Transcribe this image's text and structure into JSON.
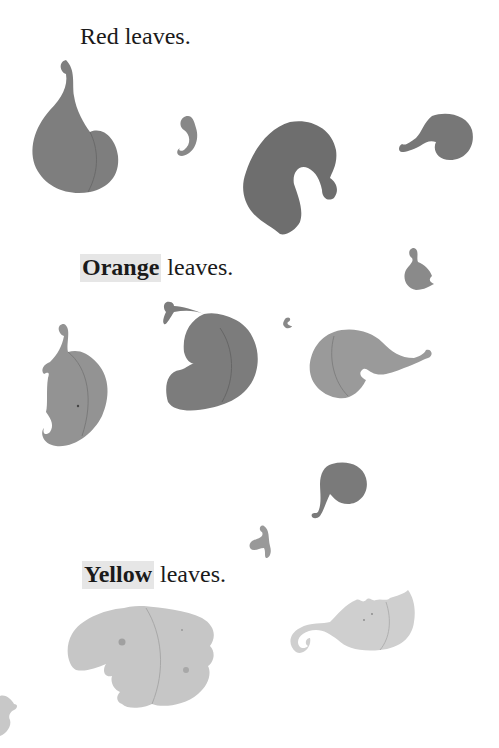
{
  "page": {
    "background": "#ffffff",
    "captions": [
      {
        "id": "red",
        "highlight": "",
        "text": "Red leaves."
      },
      {
        "id": "orange",
        "highlight": "Orange",
        "text": " leaves."
      },
      {
        "id": "yellow",
        "highlight": "Yellow",
        "text": " leaves."
      }
    ],
    "illustrations": {
      "red_leaves": {
        "count": 4,
        "tone": "#7a7a7a"
      },
      "orange_leaves": {
        "count": 6,
        "tone": "#8e8e8e"
      },
      "yellow_leaves": {
        "count": 4,
        "tone": "#c8c8c8"
      }
    }
  }
}
